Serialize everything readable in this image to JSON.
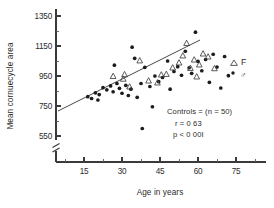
{
  "chart_data": {
    "type": "scatter",
    "title": "",
    "xlabel": "Age in years",
    "ylabel": "Mean cornuecycle area",
    "xlim": [
      8,
      80
    ],
    "ylim": [
      450,
      1400
    ],
    "xticks": [
      15,
      30,
      45,
      60,
      75
    ],
    "yticks": [
      550,
      750,
      950,
      1150,
      1350
    ],
    "xtick_labels": [
      "15",
      "30",
      "45",
      "60",
      "75"
    ],
    "ytick_labels": [
      "550",
      "750",
      "950",
      "1150",
      "1350"
    ],
    "grid": false,
    "axis_break_y": true,
    "axis_break_x": false,
    "legend_position": "right",
    "legend": [
      {
        "label": "F",
        "marker": "triangle",
        "name": "female"
      },
      {
        "label": "♂",
        "marker": "dot",
        "name": "male"
      }
    ],
    "annotations": [
      "Controls  = (n = 50)",
      "r  =  0 63",
      "p < 0 00I"
    ],
    "regression": {
      "x1": 13.5,
      "y1": 780,
      "x2": 69.0,
      "y2": 1120
    },
    "series": [
      {
        "name": "Males",
        "marker": "dot",
        "points": [
          [
            16.5,
            812
          ],
          [
            18.0,
            800
          ],
          [
            19.5,
            838
          ],
          [
            21.0,
            826
          ],
          [
            22.5,
            872
          ],
          [
            24.0,
            858
          ],
          [
            25.5,
            884
          ],
          [
            26.5,
            845
          ],
          [
            28.0,
            900
          ],
          [
            29.0,
            868
          ],
          [
            30.0,
            835
          ],
          [
            31.5,
            888
          ],
          [
            32.5,
            820
          ],
          [
            33.5,
            862
          ],
          [
            34.0,
            1142
          ],
          [
            35.0,
            1068
          ],
          [
            36.0,
            808
          ],
          [
            37.5,
            900
          ],
          [
            38.0,
            600
          ],
          [
            39.0,
            1008
          ],
          [
            41.0,
            880
          ],
          [
            43.0,
            950
          ],
          [
            44.5,
            912
          ],
          [
            46.0,
            940
          ],
          [
            48.0,
            1050
          ],
          [
            49.0,
            862
          ],
          [
            50.5,
            980
          ],
          [
            52.0,
            1012
          ],
          [
            53.5,
            955
          ],
          [
            55.0,
            1115
          ],
          [
            56.5,
            1005
          ],
          [
            57.5,
            968
          ],
          [
            59.0,
            1242
          ],
          [
            60.0,
            1048
          ],
          [
            61.5,
            985
          ],
          [
            63.0,
            1060
          ],
          [
            64.5,
            908
          ],
          [
            66.0,
            1095
          ],
          [
            67.5,
            1010
          ],
          [
            69.0,
            870
          ],
          [
            70.5,
            1080
          ],
          [
            72.0,
            952
          ],
          [
            27.0,
            1022
          ],
          [
            42.0,
            745
          ],
          [
            20.5,
            790
          ]
        ]
      },
      {
        "name": "Females",
        "marker": "triangle",
        "points": [
          [
            26.5,
            948
          ],
          [
            30.5,
            930
          ],
          [
            33.0,
            878
          ],
          [
            37.0,
            1052
          ],
          [
            40.5,
            918
          ],
          [
            44.0,
            905
          ],
          [
            47.5,
            962
          ],
          [
            50.0,
            1005
          ],
          [
            52.5,
            1038
          ],
          [
            54.0,
            1085
          ],
          [
            55.5,
            1168
          ],
          [
            57.0,
            1002
          ],
          [
            58.5,
            1058
          ],
          [
            60.5,
            1025
          ],
          [
            62.0,
            1098
          ],
          [
            64.0,
            1078
          ],
          [
            66.5,
            1000
          ],
          [
            59.5,
            945
          ],
          [
            45.5,
            958
          ],
          [
            31.0,
            960
          ]
        ]
      }
    ]
  }
}
